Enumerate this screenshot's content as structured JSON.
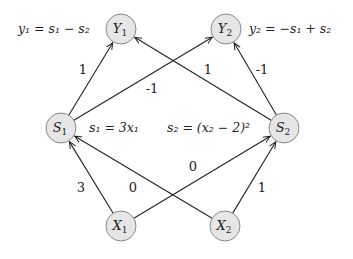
{
  "nodes": [
    {
      "id": "Y1",
      "base": "Y",
      "sub": "1",
      "x": 121,
      "y": 29
    },
    {
      "id": "Y2",
      "base": "Y",
      "sub": "2",
      "x": 226,
      "y": 29
    },
    {
      "id": "S1",
      "base": "S",
      "sub": "1",
      "x": 61,
      "y": 128
    },
    {
      "id": "S2",
      "base": "S",
      "sub": "2",
      "x": 284,
      "y": 128
    },
    {
      "id": "X1",
      "base": "X",
      "sub": "1",
      "x": 121,
      "y": 226
    },
    {
      "id": "X2",
      "base": "X",
      "sub": "2",
      "x": 225,
      "y": 226
    }
  ],
  "edges": [
    {
      "from": "S1",
      "to": "Y1",
      "weight": "1",
      "lx": 83,
      "ly": 74
    },
    {
      "from": "S1",
      "to": "Y2",
      "weight": "-1",
      "lx": 152,
      "ly": 93
    },
    {
      "from": "S2",
      "to": "Y1",
      "weight": "1",
      "lx": 208,
      "ly": 74
    },
    {
      "from": "S2",
      "to": "Y2",
      "weight": "-1",
      "lx": 262,
      "ly": 74
    },
    {
      "from": "X1",
      "to": "S1",
      "weight": "3",
      "lx": 81,
      "ly": 192
    },
    {
      "from": "X2",
      "to": "S1",
      "weight": "0",
      "lx": 133,
      "ly": 192
    },
    {
      "from": "X1",
      "to": "S2",
      "weight": "0",
      "lx": 193,
      "ly": 171
    },
    {
      "from": "X2",
      "to": "S2",
      "weight": "1",
      "lx": 262,
      "ly": 192
    }
  ],
  "equations": {
    "y1": "y₁ = s₁ − s₂",
    "y2": "y₂ = −s₁ + s₂",
    "s1": "s₁ = 3x₁",
    "s2": "s₂ = (x₂ − 2)²"
  }
}
